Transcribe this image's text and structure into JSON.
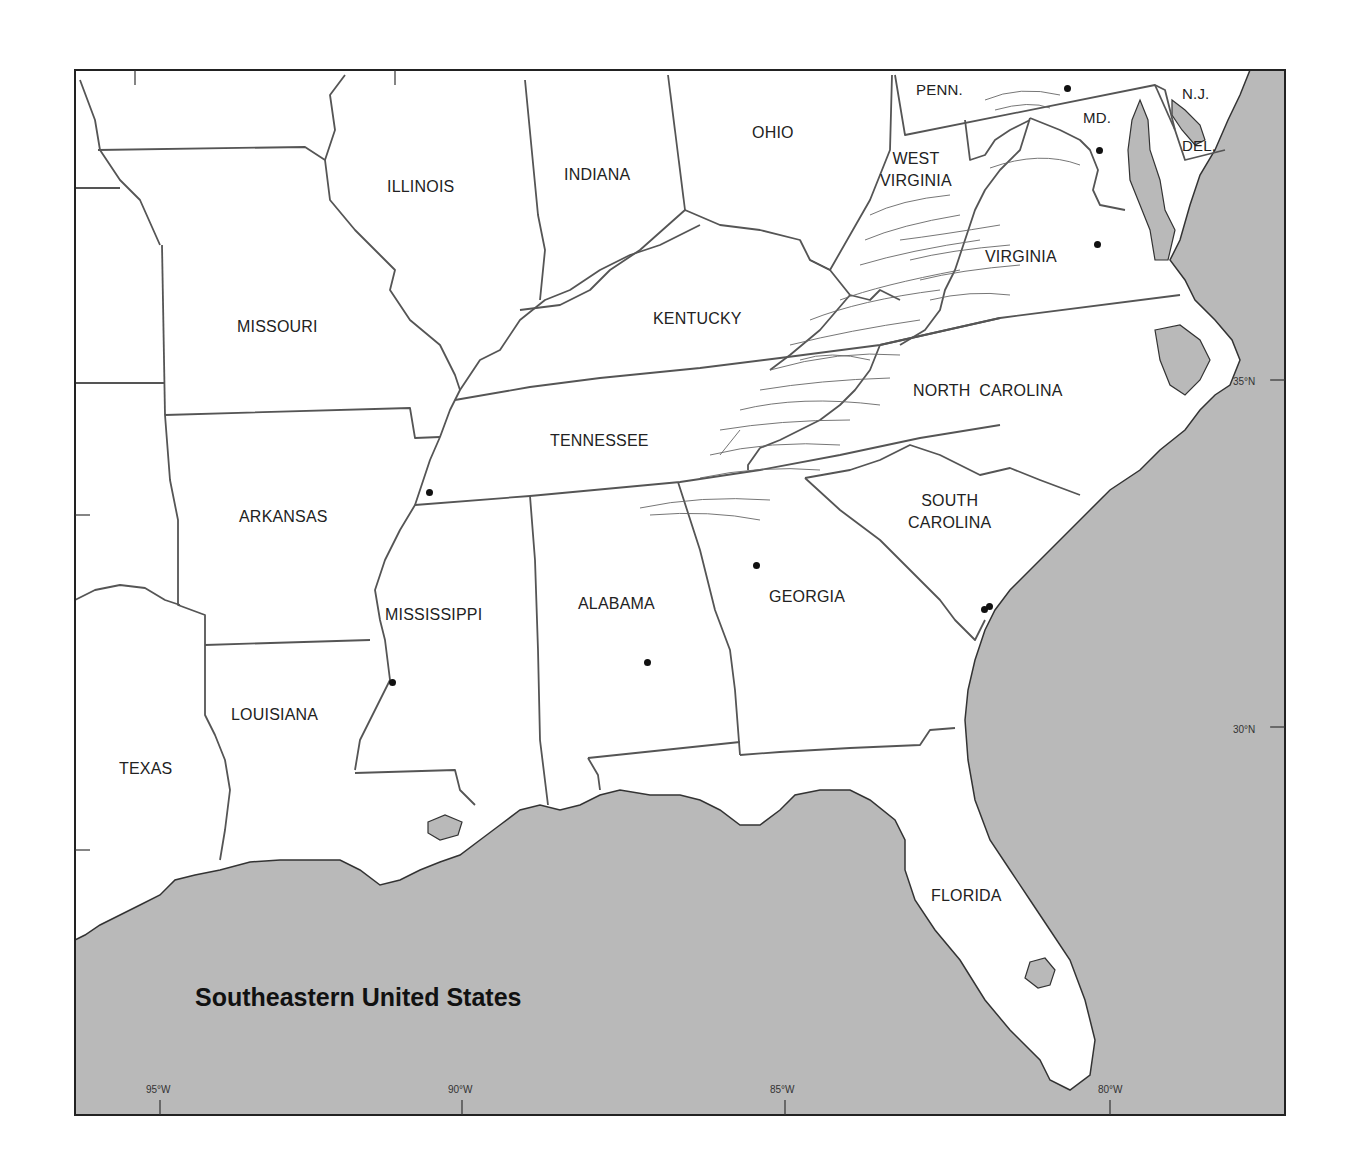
{
  "map": {
    "title": "Southeastern United States",
    "colors": {
      "land": "#ffffff",
      "water": "#b8b8b8",
      "border": "#555555",
      "frame": "#333333",
      "text": "#222222"
    },
    "states": [
      {
        "name": "ILLINOIS"
      },
      {
        "name": "INDIANA"
      },
      {
        "name": "OHIO"
      },
      {
        "name": "PENN."
      },
      {
        "name": "N.J."
      },
      {
        "name": "MD."
      },
      {
        "name": "DEL."
      },
      {
        "name": "WEST VIRGINIA",
        "line1": "WEST",
        "line2": "VIRGINIA"
      },
      {
        "name": "VIRGINIA"
      },
      {
        "name": "MISSOURI"
      },
      {
        "name": "KENTUCKY"
      },
      {
        "name": "NORTH CAROLINA"
      },
      {
        "name": "TENNESSEE"
      },
      {
        "name": "ARKANSAS"
      },
      {
        "name": "SOUTH CAROLINA",
        "line1": "SOUTH",
        "line2": "CAROLINA"
      },
      {
        "name": "MISSISSIPPI"
      },
      {
        "name": "ALABAMA"
      },
      {
        "name": "GEORGIA"
      },
      {
        "name": "LOUISIANA"
      },
      {
        "name": "TEXAS"
      },
      {
        "name": "FLORIDA"
      }
    ],
    "longitude_ticks": [
      "95°W",
      "90°W",
      "85°W",
      "80°W"
    ],
    "latitude_ticks": [
      "35°N",
      "30°N"
    ],
    "city_dots": 9
  }
}
